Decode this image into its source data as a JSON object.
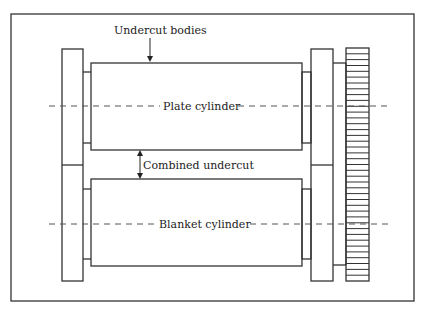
{
  "diagram": {
    "type": "printing-press cylinder cross-section",
    "labels": {
      "undercut_bodies": "Undercut bodies",
      "plate_cylinder": "Plate cylinder",
      "combined_undercut": "Combined undercut",
      "blanket_cylinder": "Blanket cylinder"
    },
    "colors": {
      "line": "#333333",
      "background": "#ffffff",
      "dashed_centerline": "#555555"
    },
    "components": [
      "outer-frame",
      "left-bearer-bracket",
      "plate-cylinder-body",
      "blanket-cylinder-body",
      "right-bearer-bracket",
      "shaft",
      "drive-gear"
    ],
    "gear_tooth_count": 40
  }
}
